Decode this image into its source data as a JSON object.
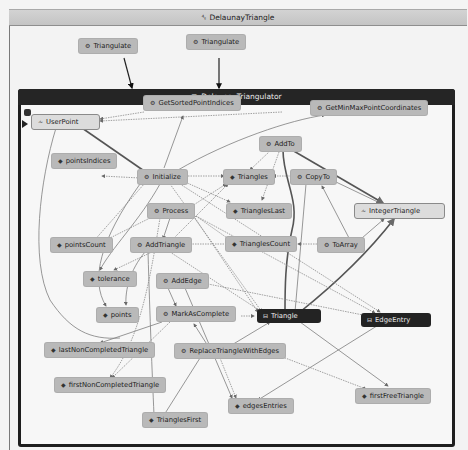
{
  "window": {
    "title": "DelaunayTriangle",
    "title_icon": "namespace-icon"
  },
  "group": {
    "title": "DelaunayTriangulator",
    "title_icon": "class-icon"
  },
  "external_nodes": [
    {
      "id": "triangulate1",
      "label": "Triangulate",
      "kind": "method"
    },
    {
      "id": "triangulate2",
      "label": "Triangulate",
      "kind": "method"
    }
  ],
  "nodes": [
    {
      "id": "GetSortedPointIndices",
      "label": "GetSortedPointIndices",
      "kind": "method"
    },
    {
      "id": "GetMinMaxPointCoordinates",
      "label": "GetMinMaxPointCoordinates",
      "kind": "method"
    },
    {
      "id": "UserPoint",
      "label": "UserPoint",
      "kind": "struct"
    },
    {
      "id": "AddTo",
      "label": "AddTo",
      "kind": "method"
    },
    {
      "id": "pointsIndices",
      "label": "pointsIndices",
      "kind": "field"
    },
    {
      "id": "Initialize",
      "label": "Initialize",
      "kind": "method"
    },
    {
      "id": "Triangles",
      "label": "Triangles",
      "kind": "field"
    },
    {
      "id": "CopyTo",
      "label": "CopyTo",
      "kind": "method"
    },
    {
      "id": "TrianglesLast",
      "label": "TrianglesLast",
      "kind": "field"
    },
    {
      "id": "IntegerTriangle",
      "label": "IntegerTriangle",
      "kind": "struct"
    },
    {
      "id": "Process",
      "label": "Process",
      "kind": "method"
    },
    {
      "id": "pointsCount",
      "label": "pointsCount",
      "kind": "field"
    },
    {
      "id": "AddTriangle",
      "label": "AddTriangle",
      "kind": "method"
    },
    {
      "id": "TrianglesCount",
      "label": "TrianglesCount",
      "kind": "field"
    },
    {
      "id": "ToArray",
      "label": "ToArray",
      "kind": "method"
    },
    {
      "id": "tolerance",
      "label": "tolerance",
      "kind": "field"
    },
    {
      "id": "AddEdge",
      "label": "AddEdge",
      "kind": "method"
    },
    {
      "id": "points",
      "label": "points",
      "kind": "field"
    },
    {
      "id": "MarkAsComplete",
      "label": "MarkAsComplete",
      "kind": "method"
    },
    {
      "id": "Triangle",
      "label": "Triangle",
      "kind": "class"
    },
    {
      "id": "EdgeEntry",
      "label": "EdgeEntry",
      "kind": "class"
    },
    {
      "id": "lastNonCompletedTriangle",
      "label": "lastNonCompletedTriangle",
      "kind": "field"
    },
    {
      "id": "ReplaceTriangleWithEdges",
      "label": "ReplaceTriangleWithEdges",
      "kind": "method"
    },
    {
      "id": "firstNonCompletedTriangle",
      "label": "firstNonCompletedTriangle",
      "kind": "field"
    },
    {
      "id": "edgesEntries",
      "label": "edgesEntries",
      "kind": "field"
    },
    {
      "id": "firstFreeTriangle",
      "label": "firstFreeTriangle",
      "kind": "field"
    },
    {
      "id": "TrianglesFirst",
      "label": "TrianglesFirst",
      "kind": "field"
    }
  ],
  "icons": {
    "method": "⚙",
    "field": "◆",
    "struct": "⩪",
    "class": "⊟"
  }
}
